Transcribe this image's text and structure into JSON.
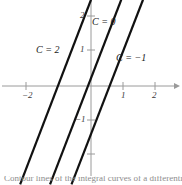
{
  "figure": {
    "title": "",
    "background_color": "#ffffff",
    "axis_color": "#9a9a9a",
    "curve_color": "#111111",
    "label_color": "#1a1a1a",
    "tick_label_color": "#3a3a3a"
  },
  "axes": {
    "x_axis_name": "x-axis",
    "y_axis_name": "y-axis",
    "x_ticks": [
      {
        "value": -2,
        "label": "−2",
        "px": 26,
        "labeled": true
      },
      {
        "value": 1,
        "label": "1",
        "px": 123,
        "labeled": true
      },
      {
        "value": 2,
        "label": "2",
        "px": 155,
        "labeled": true
      }
    ],
    "y_ticks": [
      {
        "value": 2,
        "label": "2",
        "px": 16,
        "labeled": true
      },
      {
        "value": 1,
        "label": "1",
        "px": 50,
        "labeled": true
      },
      {
        "value": -1,
        "label": "−1",
        "px": 120,
        "labeled": true
      },
      {
        "value": -2,
        "label": "",
        "px": 154,
        "labeled": false
      }
    ],
    "origin_px": {
      "x": 91,
      "y": 86
    },
    "unit_px": {
      "x": 32.5,
      "y": 34.5
    },
    "arrow_on_x_positive": true
  },
  "curve_labels": [
    {
      "text": "C = 2",
      "name": "curve-label-c2",
      "left": 36,
      "top": 45
    },
    {
      "text": "C = 0",
      "name": "curve-label-c0",
      "left": 92,
      "top": 17
    },
    {
      "text": "C = −1",
      "name": "curve-label-cminus1",
      "left": 116,
      "top": 53
    }
  ],
  "caption": {
    "text": "Contour lines of the integral curves of a differential equation"
  },
  "chart_data": {
    "type": "line",
    "title": "",
    "xlabel": "x",
    "ylabel": "y",
    "xlim": [
      -2.8,
      2.8
    ],
    "ylim": [
      -2.5,
      2.5
    ],
    "grid": false,
    "legend": "inline-annotations",
    "series": [
      {
        "name": "C = 2",
        "label": "C = 2",
        "slope": 2.45,
        "x_intercept": -1.02,
        "y_intercept": 2.5,
        "points": [
          [
            -2.18,
            -2.85
          ],
          [
            0.0,
            2.5
          ]
        ]
      },
      {
        "name": "C = 0",
        "label": "C = 0",
        "slope": 2.45,
        "x_intercept": -0.18,
        "y_intercept": 0.44,
        "points": [
          [
            -1.26,
            -2.85
          ],
          [
            0.93,
            2.5
          ]
        ]
      },
      {
        "name": "C = −1",
        "label": "C = −1",
        "slope": 2.45,
        "x_intercept": 0.5,
        "y_intercept": -1.22,
        "points": [
          [
            -0.6,
            -2.85
          ],
          [
            1.6,
            2.5
          ]
        ]
      }
    ]
  }
}
